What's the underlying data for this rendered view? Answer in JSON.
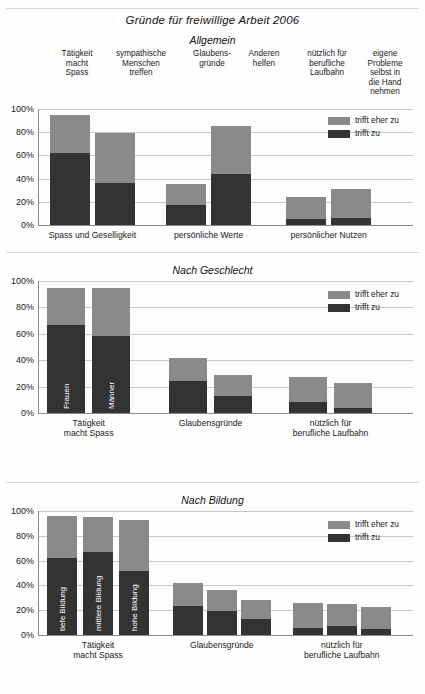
{
  "document": {
    "title": "Gründe für freiwillige Arbeit 2006"
  },
  "legend": {
    "light_label": "trifft eher zu",
    "dark_label": "trifft zu",
    "light_color": "#8a8a8a",
    "dark_color": "#333333"
  },
  "axis": {
    "ticks": [
      "0%",
      "20%",
      "40%",
      "60%",
      "80%",
      "100%"
    ]
  },
  "column_headers": [
    "Tätigkeit macht Spass",
    "sympathische Menschen treffen",
    "Glaubens- gründe",
    "Anderen helfen",
    "nützlich für berufliche Laufbahn",
    "eigene Probleme selbst in die Hand nehmen"
  ],
  "column_headers_lines": [
    [
      "Tätigkeit",
      "macht",
      "Spass"
    ],
    [
      "sympathische",
      "Menschen",
      "treffen"
    ],
    [
      "Glaubens-",
      "gründe"
    ],
    [
      "Anderen",
      "helfen"
    ],
    [
      "nützlich für",
      "berufliche",
      "Laufbahn"
    ],
    [
      "eigene",
      "Probleme",
      "selbst in",
      "die Hand",
      "nehmen"
    ]
  ],
  "panels": [
    {
      "id": "allgemein",
      "title": "Allgemein",
      "group_labels": [
        "Spass und Geselligkeit",
        "persönliche Werte",
        "persönlicher Nutzen"
      ],
      "bars": [
        {
          "label": "Tätigkeit macht Spass",
          "dark": 62,
          "light": 33,
          "total": 95
        },
        {
          "label": "sympathische Menschen treffen",
          "dark": 36,
          "light": 43,
          "total": 79
        },
        {
          "label": "Glaubensgründe",
          "dark": 17,
          "light": 18,
          "total": 35
        },
        {
          "label": "Anderen helfen",
          "dark": 44,
          "light": 41,
          "total": 85
        },
        {
          "label": "nützlich für berufliche Laufbahn",
          "dark": 5,
          "light": 19,
          "total": 24
        },
        {
          "label": "eigene Probleme selbst in die Hand nehmen",
          "dark": 6,
          "light": 25,
          "total": 31
        }
      ]
    },
    {
      "id": "nach-geschlecht",
      "title": "Nach Geschlecht",
      "group_labels": [
        "Tätigkeit macht Spass",
        "Glaubensgründe",
        "nützlich für berufliche Laufbahn"
      ],
      "group_labels_lines": [
        [
          "Tätigkeit",
          "macht Spass"
        ],
        [
          "Glaubensgründe"
        ],
        [
          "nützlich für",
          "berufliche Laufbahn"
        ]
      ],
      "bars": [
        {
          "label": "Frauen",
          "inlabel": "Frauen",
          "dark": 67,
          "light": 28,
          "total": 95
        },
        {
          "label": "Männer",
          "inlabel": "Männer",
          "dark": 58,
          "light": 37,
          "total": 95
        },
        {
          "label": "Frauen",
          "inlabel": "",
          "dark": 24,
          "light": 18,
          "total": 42
        },
        {
          "label": "Männer",
          "inlabel": "",
          "dark": 13,
          "light": 16,
          "total": 29
        },
        {
          "label": "Frauen",
          "inlabel": "",
          "dark": 8,
          "light": 19,
          "total": 27
        },
        {
          "label": "Männer",
          "inlabel": "",
          "dark": 4,
          "light": 19,
          "total": 23
        }
      ]
    },
    {
      "id": "nach-bildung",
      "title": "Nach Bildung",
      "group_labels": [
        "Tätigkeit macht Spass",
        "Glaubensgründe",
        "nützlich für berufliche Laufbahn"
      ],
      "group_labels_lines": [
        [
          "Tätigkeit",
          "macht Spass"
        ],
        [
          "Glaubensgründe"
        ],
        [
          "nützlich für",
          "berufliche Laufbahn"
        ]
      ],
      "bars": [
        {
          "label": "tiefe Bildung",
          "inlabel": "tiefe Bildung",
          "dark": 62,
          "light": 34,
          "total": 96
        },
        {
          "label": "mittlere Bildung",
          "inlabel": "mittlere Bildung",
          "dark": 67,
          "light": 28,
          "total": 95
        },
        {
          "label": "hohe Bildung",
          "inlabel": "hohe Bildung",
          "dark": 52,
          "light": 41,
          "total": 93
        },
        {
          "label": "tiefe Bildung",
          "inlabel": "",
          "dark": 23,
          "light": 19,
          "total": 42
        },
        {
          "label": "mittlere Bildung",
          "inlabel": "",
          "dark": 19,
          "light": 17,
          "total": 36
        },
        {
          "label": "hohe Bildung",
          "inlabel": "",
          "dark": 13,
          "light": 15,
          "total": 28
        },
        {
          "label": "tiefe Bildung",
          "inlabel": "",
          "dark": 6,
          "light": 20,
          "total": 26
        },
        {
          "label": "mittlere Bildung",
          "inlabel": "",
          "dark": 7,
          "light": 18,
          "total": 25
        },
        {
          "label": "hohe Bildung",
          "inlabel": "",
          "dark": 5,
          "light": 18,
          "total": 23
        }
      ]
    }
  ],
  "chart_data": [
    {
      "type": "bar",
      "stacked": true,
      "title": "Gründe für freiwillige Arbeit 2006 — Allgemein",
      "xlabel": "",
      "ylabel": "",
      "ylim": [
        0,
        100
      ],
      "grid": true,
      "legend_position": "top-right",
      "ytick_labels": [
        "0%",
        "20%",
        "40%",
        "60%",
        "80%",
        "100%"
      ],
      "categories": [
        "Tätigkeit macht Spass",
        "sympathische Menschen treffen",
        "Glaubensgründe",
        "Anderen helfen",
        "nützlich für berufliche Laufbahn",
        "eigene Probleme selbst in die Hand nehmen"
      ],
      "group_labels": [
        "Spass und Geselligkeit",
        "persönliche Werte",
        "persönlicher Nutzen"
      ],
      "series": [
        {
          "name": "trifft zu",
          "values": [
            62,
            36,
            17,
            44,
            5,
            6
          ]
        },
        {
          "name": "trifft eher zu",
          "values": [
            33,
            43,
            18,
            41,
            19,
            25
          ]
        }
      ],
      "totals": [
        95,
        79,
        35,
        85,
        24,
        31
      ]
    },
    {
      "type": "bar",
      "stacked": true,
      "title": "Nach Geschlecht",
      "xlabel": "",
      "ylabel": "",
      "ylim": [
        0,
        100
      ],
      "grid": true,
      "legend_position": "top-right",
      "ytick_labels": [
        "0%",
        "20%",
        "40%",
        "60%",
        "80%",
        "100%"
      ],
      "categories": [
        "Tätigkeit macht Spass",
        "Glaubensgründe",
        "nützlich für berufliche Laufbahn"
      ],
      "subgroups": [
        "Frauen",
        "Männer"
      ],
      "series": [
        {
          "name": "trifft zu",
          "values": [
            [
              67,
              58
            ],
            [
              24,
              13
            ],
            [
              8,
              4
            ]
          ]
        },
        {
          "name": "trifft eher zu",
          "values": [
            [
              28,
              37
            ],
            [
              18,
              16
            ],
            [
              19,
              19
            ]
          ]
        }
      ],
      "totals": [
        [
          95,
          95
        ],
        [
          42,
          29
        ],
        [
          27,
          23
        ]
      ]
    },
    {
      "type": "bar",
      "stacked": true,
      "title": "Nach Bildung",
      "xlabel": "",
      "ylabel": "",
      "ylim": [
        0,
        100
      ],
      "grid": true,
      "legend_position": "top-right",
      "ytick_labels": [
        "0%",
        "20%",
        "40%",
        "60%",
        "80%",
        "100%"
      ],
      "categories": [
        "Tätigkeit macht Spass",
        "Glaubensgründe",
        "nützlich für berufliche Laufbahn"
      ],
      "subgroups": [
        "tiefe Bildung",
        "mittlere Bildung",
        "hohe Bildung"
      ],
      "series": [
        {
          "name": "trifft zu",
          "values": [
            [
              62,
              67,
              52
            ],
            [
              23,
              19,
              13
            ],
            [
              6,
              7,
              5
            ]
          ]
        },
        {
          "name": "trifft eher zu",
          "values": [
            [
              34,
              28,
              41
            ],
            [
              19,
              17,
              15
            ],
            [
              20,
              18,
              18
            ]
          ]
        }
      ],
      "totals": [
        [
          96,
          95,
          93
        ],
        [
          42,
          36,
          28
        ],
        [
          26,
          25,
          23
        ]
      ]
    }
  ]
}
